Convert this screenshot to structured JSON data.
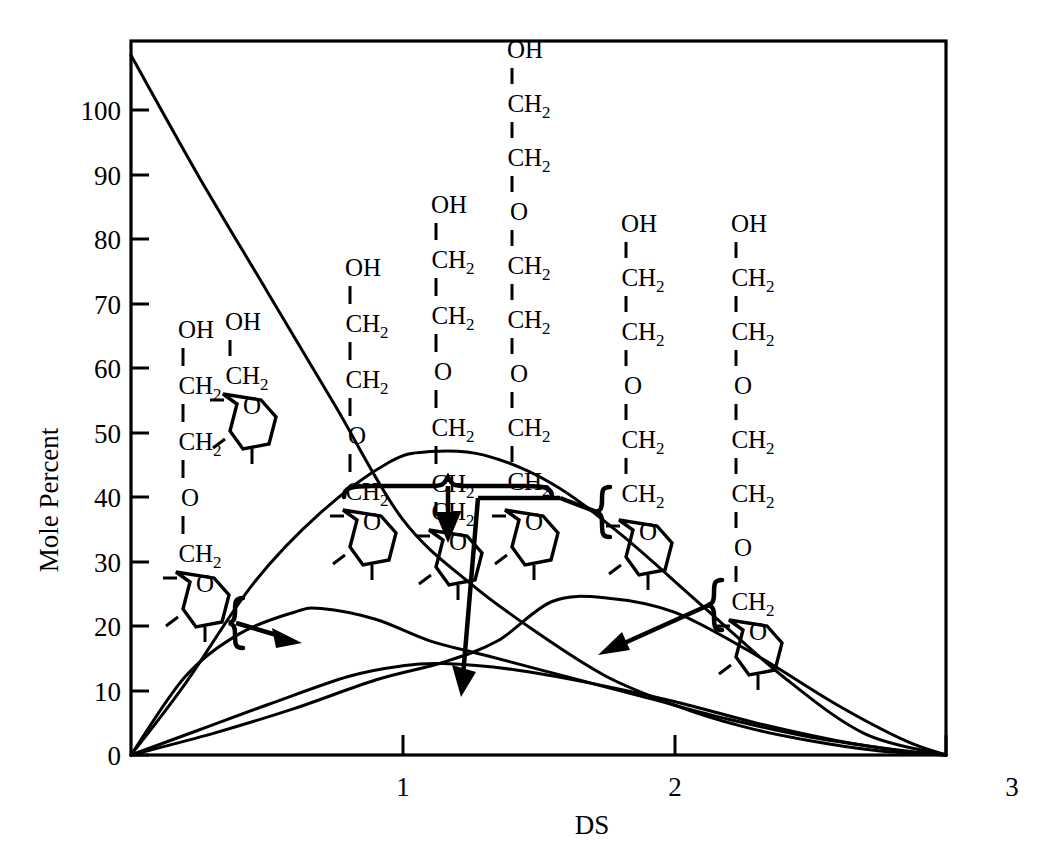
{
  "chart_data": {
    "type": "line",
    "title": "",
    "xlabel": "DS",
    "ylabel": "Mole Percent",
    "xlim": [
      0,
      3
    ],
    "ylim": [
      0,
      100
    ],
    "xticks": [
      0,
      1,
      2,
      3
    ],
    "xtick_labels": [
      "",
      "1",
      "2",
      "3"
    ],
    "yticks": [
      0,
      10,
      20,
      30,
      40,
      50,
      60,
      70,
      80,
      90,
      100
    ],
    "ytick_labels": [
      "0",
      "10",
      "20",
      "30",
      "40",
      "50",
      "60",
      "70",
      "80",
      "90",
      "100"
    ],
    "grid": false,
    "legend": "none",
    "series": [
      {
        "name": "unsubstituted anhydroglucose unit",
        "points_x": [
          0.0,
          0.25,
          0.5,
          0.75,
          1.0,
          1.25,
          1.5,
          1.75,
          2.0,
          2.25,
          2.5,
          2.75,
          3.0
        ],
        "points_y": [
          98,
          81,
          65,
          49,
          33,
          24,
          17,
          11,
          7,
          4,
          2,
          0.6,
          0
        ]
      },
      {
        "name": "mono-substituted distribution",
        "points_x": [
          0.0,
          0.2,
          0.4,
          0.6,
          0.7,
          0.9,
          1.1,
          1.3,
          1.6,
          1.9,
          2.2,
          2.5,
          2.8,
          3.0
        ],
        "points_y": [
          0,
          11,
          17,
          20,
          20.5,
          19,
          16,
          14,
          11,
          8,
          5,
          2.5,
          0.8,
          0
        ]
      },
      {
        "name": "grouped substituted species (braced set)",
        "points_x": [
          0.0,
          0.2,
          0.45,
          0.7,
          0.95,
          1.1,
          1.3,
          1.55,
          1.8,
          2.1,
          2.4,
          2.7,
          3.0
        ],
        "points_y": [
          0,
          10,
          24,
          34,
          41,
          42.5,
          42,
          38,
          31,
          21,
          11,
          3,
          0
        ]
      },
      {
        "name": "higher oxyethylated species",
        "points_x": [
          0.0,
          0.3,
          0.6,
          0.9,
          1.15,
          1.35,
          1.55,
          1.75,
          2.0,
          2.3,
          2.6,
          2.85,
          3.0
        ],
        "points_y": [
          0,
          3,
          6.5,
          10.5,
          13,
          16,
          21.5,
          22,
          20,
          14,
          7,
          2,
          0
        ]
      },
      {
        "name": "low-level species",
        "points_x": [
          0.0,
          0.25,
          0.5,
          0.8,
          1.0,
          1.15,
          1.4,
          1.7,
          2.0,
          2.3,
          2.6,
          2.85,
          3.0
        ],
        "points_y": [
          0,
          3.5,
          7,
          11,
          12.5,
          12.8,
          12,
          10,
          7.5,
          4.5,
          2,
          0.5,
          0
        ]
      }
    ]
  },
  "axes": {
    "y_label": "Mole Percent",
    "x_label": "DS",
    "y_ticks": [
      "100",
      "90",
      "80",
      "70",
      "60",
      "50",
      "40",
      "30",
      "20",
      "10",
      "0"
    ],
    "x_ticks": [
      "1",
      "2",
      "3"
    ]
  },
  "structures": [
    {
      "id": "structure-1",
      "chain": [
        "OH",
        "CH2",
        "CH2",
        "O",
        "CH2"
      ],
      "ring_label": "O",
      "ethylene_oxide_units": 1
    },
    {
      "id": "structure-2",
      "chain": [
        "OH",
        "CH2"
      ],
      "ring_label": "O",
      "ethylene_oxide_units": 0
    },
    {
      "id": "structure-3",
      "chain": [
        "OH",
        "CH2",
        "CH2",
        "O",
        "CH2"
      ],
      "ring_label": "O",
      "ethylene_oxide_units": 1
    },
    {
      "id": "structure-4",
      "chain": [
        "OH",
        "CH2",
        "CH2",
        "O",
        "CH2",
        "CH2",
        "O",
        "CH2"
      ],
      "ring_label": "O",
      "ethylene_oxide_units": 2
    },
    {
      "id": "structure-5",
      "chain": [
        "OH",
        "CH2",
        "CH2",
        "O",
        "CH2",
        "CH2",
        "O",
        "CH2",
        "CH2",
        "O",
        "CH2"
      ],
      "ring_label": "O",
      "ethylene_oxide_units": 3
    },
    {
      "id": "structure-6",
      "chain": [
        "OH",
        "CH2",
        "CH2",
        "O",
        "CH2",
        "CH2",
        "O",
        "CH2"
      ],
      "ring_label": "O",
      "ethylene_oxide_units": 2
    },
    {
      "id": "structure-7",
      "chain": [
        "OH",
        "CH2",
        "CH2",
        "O",
        "CH2",
        "CH2",
        "O",
        "CH2",
        "CH2",
        "O",
        "CH2"
      ],
      "ring_label": "O",
      "ethylene_oxide_units": 3
    }
  ],
  "glyphs": {
    "sub_two": "2",
    "oh": "OH",
    "ch": "CH",
    "o": "O"
  },
  "colors": {
    "ink": "#000000",
    "background": "#ffffff"
  }
}
